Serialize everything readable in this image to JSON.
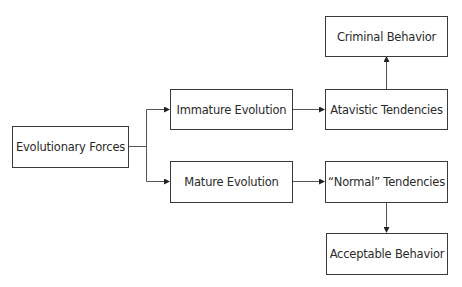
{
  "diagram": {
    "type": "flowchart",
    "nodes": [
      {
        "id": "evolutionary_forces",
        "label": "Evolutionary Forces"
      },
      {
        "id": "immature_evolution",
        "label": "Immature Evolution"
      },
      {
        "id": "mature_evolution",
        "label": "Mature Evolution"
      },
      {
        "id": "atavistic_tendencies",
        "label": "Atavistic Tendencies"
      },
      {
        "id": "normal_tendencies",
        "label": "“Normal” Tendencies"
      },
      {
        "id": "criminal_behavior",
        "label": "Criminal Behavior"
      },
      {
        "id": "acceptable_behavior",
        "label": "Acceptable Behavior"
      }
    ],
    "edges": [
      {
        "from": "evolutionary_forces",
        "to": "immature_evolution"
      },
      {
        "from": "evolutionary_forces",
        "to": "mature_evolution"
      },
      {
        "from": "immature_evolution",
        "to": "atavistic_tendencies"
      },
      {
        "from": "mature_evolution",
        "to": "normal_tendencies"
      },
      {
        "from": "atavistic_tendencies",
        "to": "criminal_behavior"
      },
      {
        "from": "normal_tendencies",
        "to": "acceptable_behavior"
      }
    ],
    "colors": {
      "stroke": "#3a3a3a",
      "text": "#2a2a2a",
      "background": "#ffffff"
    }
  }
}
